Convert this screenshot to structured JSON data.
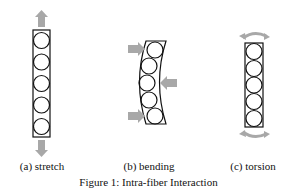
{
  "figure": {
    "caption": "Figure 1: Intra-fiber Interaction",
    "panels": [
      {
        "label": "(a) stretch",
        "arrows": "up/down pull arrows"
      },
      {
        "label": "(b) bending",
        "arrows": "lateral push arrows"
      },
      {
        "label": "(c) torsion",
        "arrows": "curved twist arrows"
      }
    ],
    "colors": {
      "arrow": "#a8a8a8",
      "outline": "#111111"
    },
    "circles_per_fiber": 5
  }
}
